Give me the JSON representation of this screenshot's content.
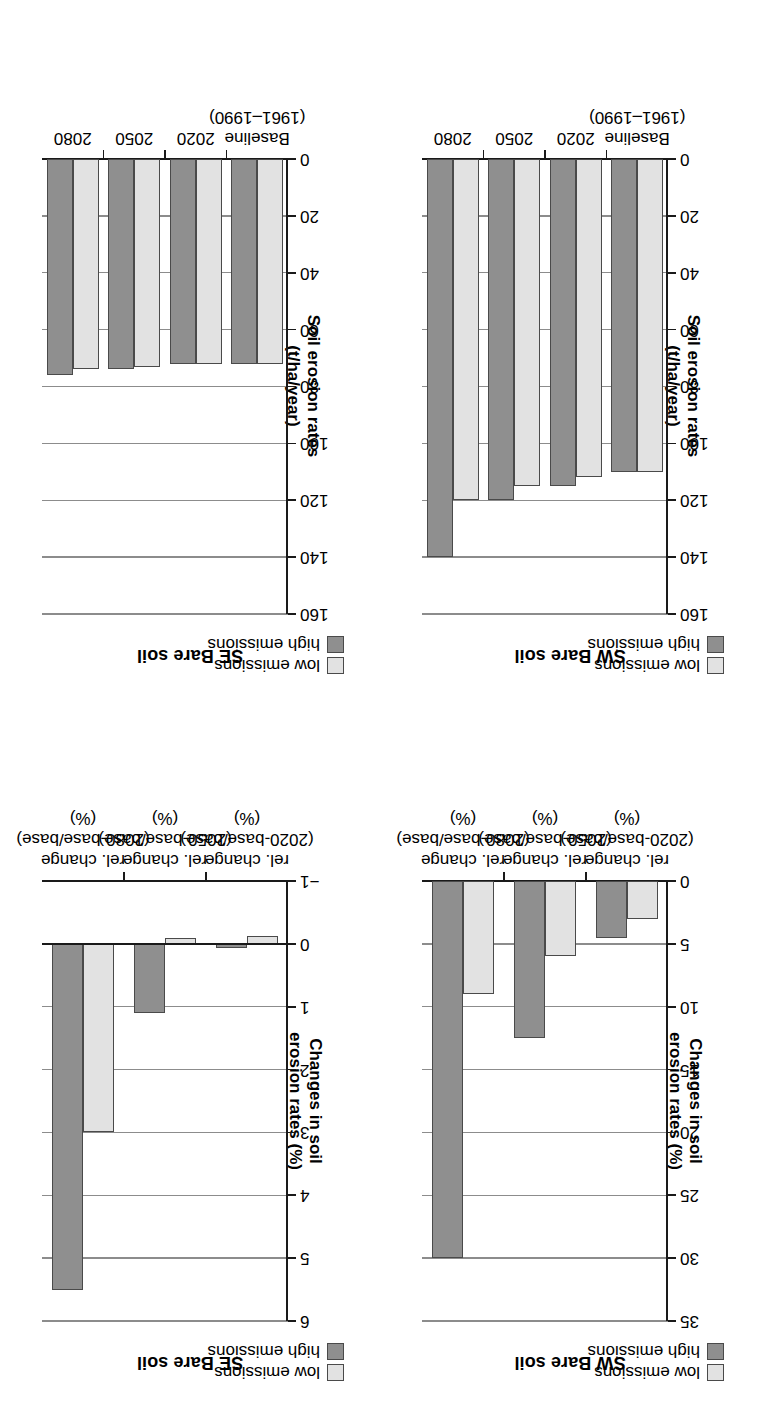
{
  "figure": {
    "orientation_note": "rotated-180",
    "colors": {
      "low_emissions": "#e2e2e2",
      "high_emissions": "#8f8f8f",
      "bar_outline": "#4a4a4a",
      "axis": "#1a1a1a",
      "gridline": "#8c8c8c",
      "background": "#ffffff"
    },
    "legend": {
      "items": [
        {
          "label": "low emissions",
          "color": "#e2e2e2"
        },
        {
          "label": "high emissions",
          "color": "#8f8f8f"
        }
      ]
    }
  },
  "panels": [
    {
      "id": "sw-bare-soil-rates",
      "title": "SW Bare soil",
      "ylabel_line1": "Soil erosion rates",
      "ylabel_line2": "(t/ha/year)",
      "categories": [
        "Baseline\n(1961–1990)",
        "2020",
        "2050",
        "2080"
      ],
      "category_labels": [
        {
          "line1": "Baseline",
          "line2": "(1961–1990)"
        },
        {
          "line1": "2020",
          "line2": ""
        },
        {
          "line1": "2050",
          "line2": ""
        },
        {
          "line1": "2080",
          "line2": ""
        }
      ],
      "yticks": [
        0,
        20,
        40,
        60,
        80,
        100,
        120,
        140,
        160
      ],
      "ylim": [
        0,
        160
      ]
    },
    {
      "id": "se-bare-soil-rates",
      "title": "SE Bare soil",
      "ylabel_line1": "Soil erosion rates",
      "ylabel_line2": "(t/ha/year)",
      "categories": [
        "Baseline\n(1961–1990)",
        "2020",
        "2050",
        "2080"
      ],
      "category_labels": [
        {
          "line1": "Baseline",
          "line2": "(1961–1990)"
        },
        {
          "line1": "2020",
          "line2": ""
        },
        {
          "line1": "2050",
          "line2": ""
        },
        {
          "line1": "2080",
          "line2": ""
        }
      ],
      "yticks": [
        0,
        20,
        40,
        60,
        80,
        100,
        120,
        140,
        160
      ],
      "ylim": [
        0,
        160
      ]
    },
    {
      "id": "sw-bare-soil-changes",
      "title": "SW Bare soil",
      "ylabel_line1": "Changes in soil",
      "ylabel_line2": "erosion rates (%)",
      "categories": [
        "rel. change\n(2020-base/base)\n(%)",
        "rel. change\n(2050-base/base)\n(%)",
        "rel. change\n(2080-base/base)\n(%)"
      ],
      "category_labels": [
        {
          "line1": "rel. change",
          "line2": "(2020-base/base)",
          "line3": "(%)"
        },
        {
          "line1": "rel. change",
          "line2": "(2050-base/base)",
          "line3": "(%)"
        },
        {
          "line1": "rel. change",
          "line2": "(2080-base/base)",
          "line3": "(%)"
        }
      ],
      "yticks": [
        0,
        5,
        10,
        15,
        20,
        25,
        30,
        35
      ],
      "ylim": [
        0,
        35
      ]
    },
    {
      "id": "se-bare-soil-changes",
      "title": "SE Bare soil",
      "ylabel_line1": "Changes in soil",
      "ylabel_line2": "erosion rates (%)",
      "categories": [
        "rel. change\n(2020-base/base)\n(%)",
        "rel. change\n(2050-base/base)\n(%)",
        "rel. change\n(2080-base/base)\n(%)"
      ],
      "category_labels": [
        {
          "line1": "rel. change",
          "line2": "(2020-base/base)",
          "line3": "(%)"
        },
        {
          "line1": "rel. change",
          "line2": "(2050-base/base)",
          "line3": "(%)"
        },
        {
          "line1": "rel. change",
          "line2": "(2080-base/base)",
          "line3": "(%)"
        }
      ],
      "yticks": [
        -1,
        0,
        1,
        2,
        3,
        4,
        5,
        6
      ],
      "ylim": [
        -1,
        6
      ]
    }
  ],
  "chart_data": [
    {
      "type": "bar",
      "id": "sw-bare-soil-rates",
      "title": "SW Bare soil",
      "xlabel": "",
      "ylabel": "Soil erosion rates (t/ha/year)",
      "categories": [
        "Baseline (1961–1990)",
        "2020",
        "2050",
        "2080"
      ],
      "series": [
        {
          "name": "low emissions",
          "color": "#e2e2e2",
          "values": [
            110,
            112,
            115,
            120
          ]
        },
        {
          "name": "high emissions",
          "color": "#8f8f8f",
          "values": [
            110,
            115,
            120,
            140
          ]
        }
      ],
      "yticks": [
        0,
        20,
        40,
        60,
        80,
        100,
        120,
        140,
        160
      ],
      "ylim": [
        0,
        160
      ],
      "grid": true,
      "legend_position": "top-left"
    },
    {
      "type": "bar",
      "id": "se-bare-soil-rates",
      "title": "SE Bare soil",
      "xlabel": "",
      "ylabel": "Soil erosion rates (t/ha/year)",
      "categories": [
        "Baseline (1961–1990)",
        "2020",
        "2050",
        "2080"
      ],
      "series": [
        {
          "name": "low emissions",
          "color": "#e2e2e2",
          "values": [
            72,
            72,
            73,
            74
          ]
        },
        {
          "name": "high emissions",
          "color": "#8f8f8f",
          "values": [
            72,
            72,
            74,
            76
          ]
        }
      ],
      "yticks": [
        0,
        20,
        40,
        60,
        80,
        100,
        120,
        140,
        160
      ],
      "ylim": [
        0,
        160
      ],
      "grid": true,
      "legend_position": "top-left"
    },
    {
      "type": "bar",
      "id": "sw-bare-soil-changes",
      "title": "SW Bare soil",
      "xlabel": "",
      "ylabel": "Changes in soil erosion rates (%)",
      "categories": [
        "rel. change (2020-base/base) (%)",
        "rel. change (2050-base/base) (%)",
        "rel. change (2080-base/base) (%)"
      ],
      "series": [
        {
          "name": "low emissions",
          "color": "#e2e2e2",
          "values": [
            3.0,
            6.0,
            9.0
          ]
        },
        {
          "name": "high emissions",
          "color": "#8f8f8f",
          "values": [
            4.5,
            12.5,
            30.0
          ]
        }
      ],
      "yticks": [
        0,
        5,
        10,
        15,
        20,
        25,
        30,
        35
      ],
      "ylim": [
        0,
        35
      ],
      "grid": true,
      "legend_position": "top-left"
    },
    {
      "type": "bar",
      "id": "se-bare-soil-changes",
      "title": "SE Bare soil",
      "xlabel": "",
      "ylabel": "Changes in soil erosion rates (%)",
      "categories": [
        "rel. change (2020-base/base) (%)",
        "rel. change (2050-base/base) (%)",
        "rel. change (2080-base/base) (%)"
      ],
      "series": [
        {
          "name": "low emissions",
          "color": "#e2e2e2",
          "values": [
            -0.12,
            -0.1,
            3.0
          ]
        },
        {
          "name": "high emissions",
          "color": "#8f8f8f",
          "values": [
            0.06,
            1.1,
            5.5
          ]
        }
      ],
      "yticks": [
        -1,
        0,
        1,
        2,
        3,
        4,
        5,
        6
      ],
      "ylim": [
        -1,
        6
      ],
      "grid": true,
      "legend_position": "top-left"
    }
  ]
}
